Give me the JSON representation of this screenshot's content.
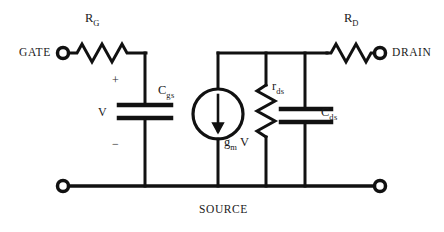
{
  "diagram": {
    "title_text": "",
    "type": "small-signal FET equivalent circuit",
    "stroke_color": "#111111",
    "background_color": "#ffffff"
  },
  "terminals": [
    {
      "id": "gate",
      "label": "GATE",
      "x": 62,
      "y": 53
    },
    {
      "id": "drain",
      "label": "DRAIN",
      "x": 380,
      "y": 53
    },
    {
      "id": "source_left",
      "label": "",
      "x": 62,
      "y": 186
    },
    {
      "id": "source_right",
      "label": "",
      "x": 380,
      "y": 186
    }
  ],
  "rail_label": {
    "source": "SOURCE"
  },
  "components": [
    {
      "id": "rg",
      "kind": "resistor-horizontal",
      "label_main": "R",
      "label_sub": "G"
    },
    {
      "id": "cgs",
      "kind": "capacitor-vertical",
      "label_main": "C",
      "label_sub": "gs"
    },
    {
      "id": "vsource_node",
      "kind": "voltage-annotation",
      "plus": "+",
      "minus": "−",
      "label_main": "V"
    },
    {
      "id": "gm_source",
      "kind": "current-source",
      "label_main": "g",
      "label_sub": "m",
      "label_tail": "V",
      "arrow_direction": "down"
    },
    {
      "id": "rds",
      "kind": "resistor-vertical",
      "label_main": "r",
      "label_sub": "ds"
    },
    {
      "id": "cds",
      "kind": "capacitor-vertical",
      "label_main": "C",
      "label_sub": "ds"
    },
    {
      "id": "rd",
      "kind": "resistor-horizontal",
      "label_main": "R",
      "label_sub": "D"
    }
  ]
}
